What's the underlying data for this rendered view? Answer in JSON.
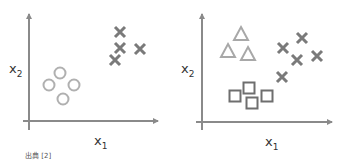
{
  "caption": "出典 [2]",
  "colors": {
    "axis": "#8a8a8a",
    "circle": "#b0b0b0",
    "cross": "#7a7a7a",
    "triangle": "#a8a8a8",
    "square": "#6e6e6e"
  },
  "chart_data": [
    {
      "type": "scatter",
      "title": "",
      "xlabel": "x1",
      "ylabel": "x2",
      "grid": false,
      "legend": "none",
      "series": [
        {
          "name": "circle",
          "marker": "o",
          "points": [
            [
              60,
              73
            ],
            [
              49,
              85
            ],
            [
              74,
              85
            ],
            [
              63,
              99
            ]
          ]
        },
        {
          "name": "cross",
          "marker": "x",
          "points": [
            [
              120,
              32
            ],
            [
              120,
              48
            ],
            [
              140,
              49
            ],
            [
              115,
              60
            ]
          ]
        }
      ]
    },
    {
      "type": "scatter",
      "title": "",
      "xlabel": "x1",
      "ylabel": "x2",
      "grid": false,
      "legend": "none",
      "series": [
        {
          "name": "triangle",
          "marker": "^",
          "points": [
            [
              241,
              34
            ],
            [
              228,
              51
            ],
            [
              248,
              54
            ]
          ]
        },
        {
          "name": "cross",
          "marker": "x",
          "points": [
            [
              302,
              38
            ],
            [
              283,
              48
            ],
            [
              297,
              60
            ],
            [
              317,
              56
            ],
            [
              282,
              77
            ]
          ]
        },
        {
          "name": "square",
          "marker": "s",
          "points": [
            [
              235,
              96
            ],
            [
              249,
              88
            ],
            [
              252,
              103
            ],
            [
              267,
              96
            ]
          ]
        }
      ]
    }
  ],
  "labels": {
    "left_x": "x",
    "left_x_sub": "1",
    "left_y": "x",
    "left_y_sub": "2",
    "right_x": "x",
    "right_x_sub": "1",
    "right_y": "x",
    "right_y_sub": "2"
  }
}
